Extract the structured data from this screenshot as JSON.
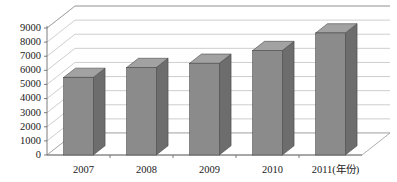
{
  "chart_data": {
    "type": "bar",
    "title": "",
    "subtitle": "",
    "xlabel": "年份",
    "ylabel": "",
    "categories": [
      "2007",
      "2008",
      "2009",
      "2010",
      "2011(年份)"
    ],
    "values": [
      5500,
      6200,
      6500,
      7400,
      8650
    ],
    "series": [
      {
        "name": "",
        "values": [
          5500,
          6200,
          6500,
          7400,
          8650
        ]
      }
    ],
    "ylim": [
      0,
      9000
    ],
    "ytick_labels": [
      "0",
      "1000",
      "2000",
      "3000",
      "4000",
      "5000",
      "6000",
      "7000",
      "8000",
      "9000"
    ],
    "ytick_values": [
      0,
      1000,
      2000,
      3000,
      4000,
      5000,
      6000,
      7000,
      8000,
      9000
    ],
    "grid": true,
    "legend": false,
    "legend_position": "none",
    "three_d": true,
    "annotations": []
  },
  "style": {
    "bar_front_color": "#8b8b8b",
    "bar_side_color": "#6d6d6d",
    "bar_top_color": "#a2a2a2",
    "bar_edge_color": "#4a4a4a",
    "gridline_color": "#b9b9b9",
    "axis_color": "#6e6e6e",
    "text_color": "#1a1a1a",
    "background_color": "#ffffff"
  },
  "labels": {
    "y_axis_name": "y-axis-value-labels",
    "x_axis_name": "x-axis-category-labels"
  }
}
